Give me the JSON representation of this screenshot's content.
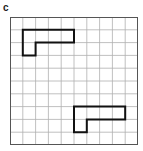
{
  "panel": {
    "label": "c"
  },
  "grid": {
    "rows": 10,
    "cols": 10,
    "cell_px": 12.8,
    "line_color": "#b0b0b0",
    "border_color": "#555555"
  },
  "shapes": [
    {
      "name": "L-shape-top",
      "cells": [
        [
          1,
          1
        ],
        [
          1,
          2
        ],
        [
          1,
          3
        ],
        [
          1,
          4
        ],
        [
          2,
          1
        ]
      ],
      "stroke": "#111111"
    },
    {
      "name": "L-shape-bottom",
      "cells": [
        [
          7,
          5
        ],
        [
          7,
          6
        ],
        [
          7,
          7
        ],
        [
          7,
          8
        ],
        [
          8,
          5
        ]
      ],
      "stroke": "#111111"
    }
  ]
}
